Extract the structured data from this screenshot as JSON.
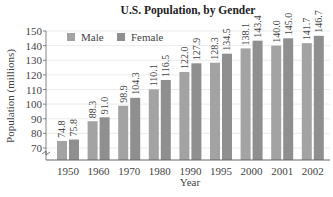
{
  "chart_data": {
    "type": "bar",
    "title": "U.S. Population, by Gender",
    "xlabel": "Year",
    "ylabel": "Population (millions)",
    "ylim": [
      70,
      150
    ],
    "yticks": [
      70,
      80,
      90,
      100,
      110,
      120,
      130,
      140,
      150
    ],
    "axis_break": true,
    "grid": true,
    "legend_position": "top-left, inside",
    "categories": [
      "1950",
      "1960",
      "1970",
      "1980",
      "1990",
      "1995",
      "2000",
      "2001",
      "2002"
    ],
    "series": [
      {
        "name": "Male",
        "color": "#a3a3a3",
        "values": [
          74.8,
          88.3,
          98.9,
          110.1,
          122.0,
          128.3,
          138.1,
          140.0,
          141.7
        ],
        "labels": [
          "74.8",
          "88.3",
          "98.9",
          "110.1",
          "122.0",
          "128.3",
          "138.1",
          "140.0",
          "141.7"
        ]
      },
      {
        "name": "Female",
        "color": "#8f8f8f",
        "values": [
          75.8,
          91.0,
          104.3,
          116.5,
          127.9,
          134.5,
          143.4,
          145.0,
          146.7
        ],
        "labels": [
          "75.8",
          "91.0",
          "104.3",
          "116.5",
          "127.9",
          "134.5",
          "143.4",
          "145.0",
          "146.7"
        ]
      }
    ]
  },
  "legend": {
    "male": "Male",
    "female": "Female"
  }
}
